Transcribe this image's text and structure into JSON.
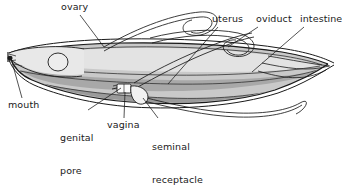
{
  "figure": {
    "organism": "nematode",
    "view": "lateral longitudinal section",
    "style": "line drawing with gray shading"
  },
  "colors": {
    "background": "#ffffff",
    "outline": "#1a1a1a",
    "body_light": "#d9d9d9",
    "body_mid": "#c2c2c2",
    "body_dark": "#a3a3a3",
    "body_darker": "#8f8f8f",
    "lumen_white": "#f4f4f4",
    "leader_line": "#1a1a1a",
    "text": "#1a1a1a"
  },
  "labels": [
    {
      "id": "ovary",
      "text": "ovary",
      "lines": [
        "ovary"
      ],
      "x": 61,
      "y": 1,
      "leader": {
        "from_x": 80,
        "from_y": 15,
        "to_x": 104,
        "to_y": 47
      }
    },
    {
      "id": "uterus",
      "text": "uterus",
      "lines": [
        "uterus"
      ],
      "x": 212,
      "y": 13,
      "leader": {
        "from_x": 218,
        "from_y": 27,
        "to_x": 168,
        "to_y": 84
      }
    },
    {
      "id": "oviduct",
      "text": "oviduct",
      "lines": [
        "oviduct"
      ],
      "x": 256,
      "y": 13,
      "leader": {
        "from_x": 258,
        "from_y": 27,
        "to_x": 228,
        "to_y": 47
      }
    },
    {
      "id": "intestine",
      "text": "intestine",
      "lines": [
        "intestine"
      ],
      "x": 300,
      "y": 13,
      "leader": {
        "from_x": 304,
        "from_y": 27,
        "to_x": 252,
        "to_y": 72
      }
    },
    {
      "id": "mouth",
      "text": "mouth",
      "lines": [
        "mouth"
      ],
      "x": 8,
      "y": 99,
      "leader": {
        "from_x": 22,
        "from_y": 98,
        "to_x": 12,
        "to_y": 62
      }
    },
    {
      "id": "genital-pore",
      "text": "genital pore",
      "lines": [
        "genital",
        "pore"
      ],
      "x": 60,
      "y": 110,
      "leader": {
        "from_x": 88,
        "from_y": 110,
        "to_x": 121,
        "to_y": 88
      }
    },
    {
      "id": "vagina",
      "text": "vagina",
      "lines": [
        "vagina"
      ],
      "x": 107,
      "y": 119,
      "leader": {
        "from_x": 124,
        "from_y": 118,
        "to_x": 125,
        "to_y": 92
      }
    },
    {
      "id": "seminal-receptacle",
      "text": "seminal receptacle",
      "lines": [
        "seminal",
        "receptacle"
      ],
      "x": 152,
      "y": 119,
      "leader": {
        "from_x": 158,
        "from_y": 118,
        "to_x": 143,
        "to_y": 98
      }
    }
  ],
  "structures": [
    {
      "id": "body-wall",
      "name": "body wall"
    },
    {
      "id": "ovary-tube",
      "name": "ovary"
    },
    {
      "id": "oviduct-tube",
      "name": "oviduct"
    },
    {
      "id": "uterus-tube",
      "name": "uterus"
    },
    {
      "id": "intestine-region",
      "name": "intestine"
    },
    {
      "id": "vagina-chamber",
      "name": "vagina"
    },
    {
      "id": "seminal-receptacle-sac",
      "name": "seminal receptacle"
    },
    {
      "id": "mouth-opening",
      "name": "mouth"
    },
    {
      "id": "genital-pore-opening",
      "name": "genital pore"
    },
    {
      "id": "pharyngeal-bulb",
      "name": "pharyngeal bulb"
    },
    {
      "id": "tail",
      "name": "tail"
    }
  ]
}
